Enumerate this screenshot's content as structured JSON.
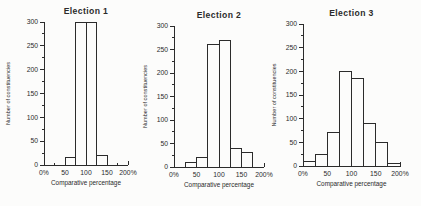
{
  "figure": {
    "background": "#fcfcfb",
    "line_color": "#2b2b2b",
    "text_color": "#2b2b2b",
    "bar_fill": "#fcfcfb"
  },
  "chart_data": [
    {
      "type": "bar",
      "title": "Election 1",
      "xlabel": "Comparative percentage",
      "ylabel": "Number of constituencies",
      "xlim": [
        0,
        200
      ],
      "ylim": [
        0,
        300
      ],
      "x_major_ticks": [
        0,
        50,
        100,
        150,
        200
      ],
      "x_tick_labels": [
        "0%",
        "50",
        "100",
        "150",
        "200%"
      ],
      "x_minor_step": 25,
      "y_major_ticks": [
        0,
        50,
        100,
        150,
        200,
        250,
        300
      ],
      "y_minor_step": 25,
      "grid": false,
      "legend": "none",
      "bin_edges": [
        50,
        75,
        100,
        125,
        150
      ],
      "counts": [
        15,
        300,
        300,
        20
      ]
    },
    {
      "type": "bar",
      "title": "Election 2",
      "xlabel": "Comparative percentage",
      "ylabel": "Number of constituencies",
      "xlim": [
        0,
        200
      ],
      "ylim": [
        0,
        300
      ],
      "x_major_ticks": [
        0,
        50,
        100,
        150,
        200
      ],
      "x_tick_labels": [
        "0%",
        "50",
        "100",
        "150",
        "200%"
      ],
      "x_minor_step": 25,
      "y_major_ticks": [
        0,
        50,
        100,
        150,
        200,
        250,
        300
      ],
      "y_minor_step": 25,
      "grid": false,
      "legend": "none",
      "bin_edges": [
        25,
        50,
        75,
        100,
        125,
        150,
        175
      ],
      "counts": [
        10,
        20,
        260,
        270,
        40,
        30
      ]
    },
    {
      "type": "bar",
      "title": "Election 3",
      "xlabel": "Comparative percentage",
      "ylabel": "Number of constituencies",
      "xlim": [
        0,
        200
      ],
      "ylim": [
        0,
        300
      ],
      "x_major_ticks": [
        0,
        50,
        100,
        150,
        200
      ],
      "x_tick_labels": [
        "0%",
        "50",
        "100",
        "150",
        "200%"
      ],
      "x_minor_step": 25,
      "y_major_ticks": [
        0,
        50,
        100,
        150,
        200,
        250,
        300
      ],
      "y_minor_step": 25,
      "grid": false,
      "legend": "none",
      "bin_edges": [
        0,
        25,
        50,
        75,
        100,
        125,
        150,
        175,
        200
      ],
      "counts": [
        10,
        25,
        70,
        200,
        185,
        90,
        50,
        5
      ]
    }
  ]
}
